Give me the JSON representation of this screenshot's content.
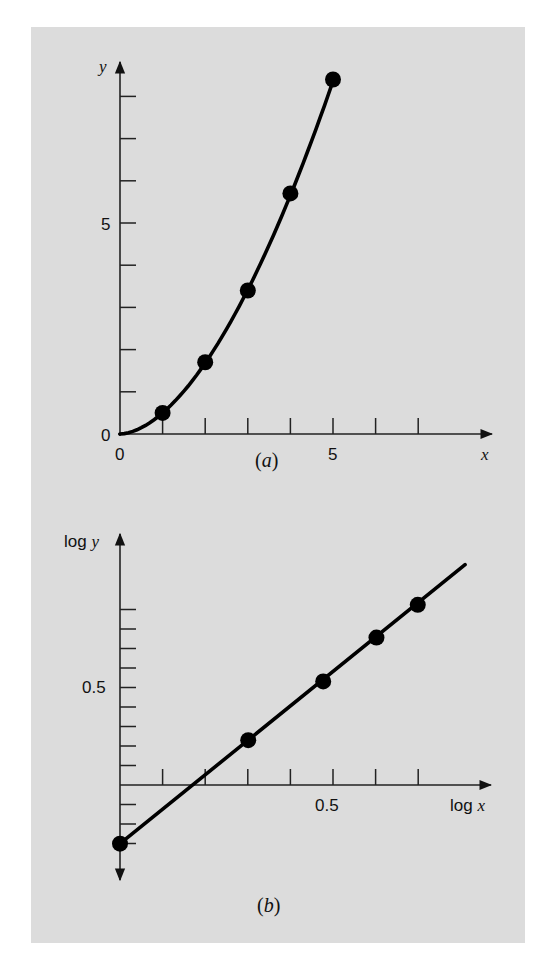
{
  "chart_data": [
    {
      "type": "line",
      "panel": "a",
      "caption": "(a)",
      "title": "",
      "xlabel": "x",
      "ylabel": "y",
      "x_tick_labels": [
        "0",
        "5"
      ],
      "y_tick_labels": [
        "0",
        "5"
      ],
      "x_ticks": [
        1,
        2,
        3,
        4,
        5,
        6,
        7
      ],
      "y_ticks": [
        1,
        2,
        3,
        4,
        5,
        6,
        7,
        8
      ],
      "xlim": [
        0,
        8.5
      ],
      "ylim": [
        0,
        8.8
      ],
      "grid": false,
      "legend": null,
      "series": [
        {
          "name": "data",
          "marker": "circle",
          "x": [
            1,
            2,
            3,
            4,
            5
          ],
          "y": [
            0.5,
            1.7,
            3.4,
            5.7,
            8.4
          ]
        },
        {
          "name": "power fit y = 0.5 x^1.75",
          "style": "curve",
          "x": [
            0,
            0.5,
            1,
            1.5,
            2,
            2.5,
            3,
            3.5,
            4,
            4.5,
            5
          ],
          "y": [
            0,
            0.15,
            0.5,
            1.01,
            1.68,
            2.49,
            3.43,
            4.5,
            5.66,
            6.95,
            8.36
          ]
        }
      ]
    },
    {
      "type": "line",
      "panel": "b",
      "caption": "(b)",
      "title": "",
      "xlabel": "log x",
      "ylabel": "log y",
      "x_tick_labels": [
        "0.5"
      ],
      "y_tick_labels": [
        "0.5"
      ],
      "x_ticks": [
        0.1,
        0.2,
        0.3,
        0.4,
        0.5,
        0.6,
        0.7
      ],
      "y_ticks": [
        -0.3,
        -0.2,
        -0.1,
        0.1,
        0.2,
        0.3,
        0.4,
        0.5,
        0.6,
        0.7,
        0.8,
        0.9
      ],
      "xlim": [
        0,
        0.86
      ],
      "ylim": [
        -0.42,
        1.28
      ],
      "grid": false,
      "legend": null,
      "series": [
        {
          "name": "data",
          "marker": "circle",
          "x": [
            0,
            0.301,
            0.477,
            0.602,
            0.699
          ],
          "y": [
            -0.301,
            0.23,
            0.531,
            0.756,
            0.924
          ]
        },
        {
          "name": "linear fit",
          "style": "line",
          "x": [
            0,
            0.81
          ],
          "y": [
            -0.301,
            1.13
          ]
        }
      ]
    }
  ],
  "labels": {
    "a": {
      "y_axis": "y",
      "x_axis": "x",
      "y_tick_0": "0",
      "y_tick_5": "5",
      "x_tick_0": "0",
      "x_tick_5": "5",
      "caption_open": "(",
      "caption_letter": "a",
      "caption_close": ")"
    },
    "b": {
      "y_axis_log": "log ",
      "y_axis_var": "y",
      "x_axis_log": "log ",
      "x_axis_var": "x",
      "y_tick_05": "0.5",
      "x_tick_05": "0.5",
      "caption_open": "(",
      "caption_letter": "b",
      "caption_close": ")"
    }
  },
  "colors": {
    "panel_background": "#dcdcdc",
    "ink": "#111111"
  }
}
